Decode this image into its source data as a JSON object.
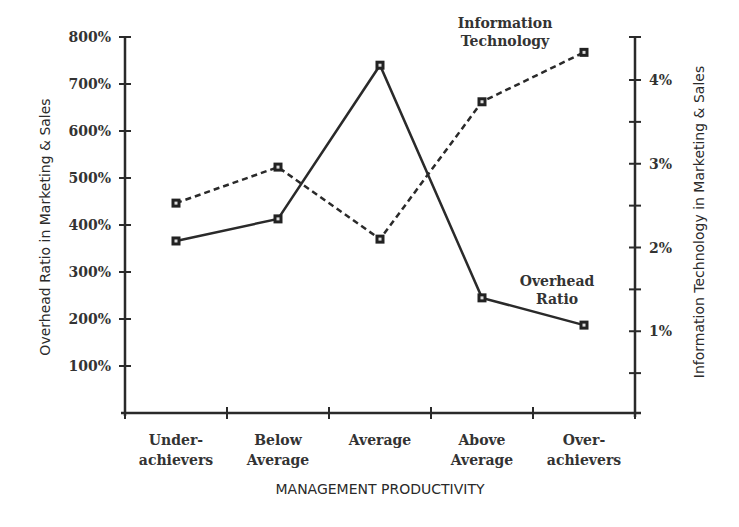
{
  "chart_data": {
    "type": "line",
    "title": "",
    "xlabel": "MANAGEMENT PRODUCTIVITY",
    "ylabel": "Overhead Ratio in Marketing & Sales",
    "y2label": "Information Technology in Marketing & Sales",
    "categories": [
      "Under-achievers",
      "Below Average",
      "Average",
      "Above Average",
      "Over-achievers"
    ],
    "category_lines": [
      [
        "Under-",
        "achievers"
      ],
      [
        "Below",
        "Average"
      ],
      [
        "Average"
      ],
      [
        "Above",
        "Average"
      ],
      [
        "Over-",
        "achievers"
      ]
    ],
    "y_ticks": [
      "100%",
      "200%",
      "300%",
      "400%",
      "500%",
      "600%",
      "700%",
      "800%"
    ],
    "y2_ticks": [
      "1%",
      "2%",
      "3%",
      "4%"
    ],
    "ylim": [
      0,
      800
    ],
    "y2lim": [
      0,
      4.5
    ],
    "grid": false,
    "series": [
      {
        "name": "Overhead Ratio",
        "axis": "left",
        "style": "solid",
        "values": [
          366,
          413,
          740,
          245,
          187
        ]
      },
      {
        "name": "Information Technology",
        "axis": "right",
        "style": "dashed",
        "values": [
          2.53,
          2.96,
          2.1,
          3.74,
          4.33
        ]
      }
    ],
    "annotations": [
      {
        "text": [
          "Information",
          "Technology"
        ],
        "series": "Information Technology"
      },
      {
        "text": [
          "Overhead",
          "Ratio"
        ],
        "series": "Overhead Ratio"
      }
    ]
  }
}
